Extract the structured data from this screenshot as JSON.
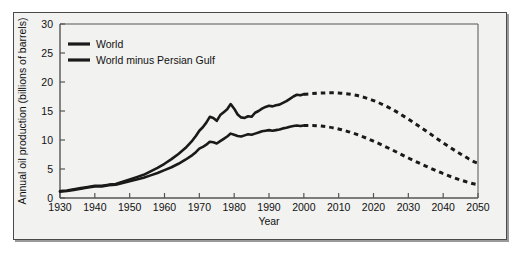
{
  "figure": {
    "background_color": "#f2f2f0",
    "frame_color": "#4a4a4a",
    "line_color": "#1a1a1a"
  },
  "chart_data": {
    "type": "line",
    "title": "",
    "xlabel": "Year",
    "ylabel": "Annual oil production (billions of barrels)",
    "xlim": [
      1930,
      2050
    ],
    "ylim": [
      0,
      30
    ],
    "xticks": [
      1930,
      1940,
      1950,
      1960,
      1970,
      1980,
      1990,
      2000,
      2010,
      2020,
      2030,
      2040,
      2050
    ],
    "yticks": [
      0,
      5,
      10,
      15,
      20,
      25,
      30
    ],
    "grid": false,
    "legend_position": "top-left",
    "legend": [
      "World",
      "World minus Persian Gulf"
    ],
    "annotations": [],
    "series": [
      {
        "name": "World",
        "style": "solid-then-dotted",
        "solid_x": [
          1930,
          1932,
          1934,
          1936,
          1938,
          1940,
          1942,
          1944,
          1946,
          1948,
          1950,
          1952,
          1954,
          1956,
          1958,
          1960,
          1962,
          1964,
          1966,
          1968,
          1969,
          1970,
          1971,
          1972,
          1973,
          1974,
          1975,
          1976,
          1977,
          1978,
          1979,
          1980,
          1981,
          1982,
          1983,
          1984,
          1985,
          1986,
          1987,
          1988,
          1989,
          1990,
          1991,
          1992,
          1993,
          1994,
          1995,
          1996,
          1997,
          1998,
          1999,
          2000
        ],
        "solid_y": [
          1.2,
          1.3,
          1.5,
          1.7,
          1.9,
          2.1,
          2.1,
          2.3,
          2.4,
          2.8,
          3.2,
          3.6,
          4.0,
          4.6,
          5.2,
          5.9,
          6.7,
          7.6,
          8.6,
          9.9,
          10.7,
          11.6,
          12.2,
          13.0,
          14.0,
          13.8,
          13.3,
          14.3,
          14.8,
          15.3,
          16.2,
          15.4,
          14.4,
          13.9,
          13.8,
          14.1,
          14.0,
          14.7,
          15.0,
          15.4,
          15.7,
          15.9,
          15.8,
          16.0,
          16.1,
          16.4,
          16.7,
          17.1,
          17.5,
          17.8,
          17.7,
          17.9
        ],
        "dotted_x": [
          2000,
          2005,
          2010,
          2015,
          2020,
          2025,
          2030,
          2035,
          2040,
          2045,
          2050
        ],
        "dotted_y": [
          17.9,
          18.1,
          18.1,
          17.7,
          16.8,
          15.4,
          13.6,
          11.6,
          9.5,
          7.6,
          6.0
        ],
        "note": "upper curve peaks near 2005 at about 18 and declines to about 5-6 by 2050"
      },
      {
        "name": "World minus Persian Gulf",
        "style": "solid-then-dotted",
        "solid_x": [
          1930,
          1932,
          1934,
          1936,
          1938,
          1940,
          1942,
          1944,
          1946,
          1948,
          1950,
          1952,
          1954,
          1956,
          1958,
          1960,
          1962,
          1964,
          1966,
          1968,
          1969,
          1970,
          1971,
          1972,
          1973,
          1974,
          1975,
          1976,
          1977,
          1978,
          1979,
          1980,
          1981,
          1982,
          1983,
          1984,
          1985,
          1986,
          1987,
          1988,
          1989,
          1990,
          1991,
          1992,
          1993,
          1994,
          1995,
          1996,
          1997,
          1998,
          1999,
          2000
        ],
        "solid_y": [
          1.1,
          1.2,
          1.4,
          1.6,
          1.8,
          2.0,
          2.0,
          2.2,
          2.3,
          2.6,
          2.9,
          3.2,
          3.5,
          3.9,
          4.3,
          4.8,
          5.3,
          5.9,
          6.6,
          7.4,
          7.9,
          8.5,
          8.8,
          9.2,
          9.7,
          9.6,
          9.4,
          9.8,
          10.2,
          10.6,
          11.1,
          10.9,
          10.7,
          10.6,
          10.8,
          11.0,
          10.9,
          11.1,
          11.3,
          11.5,
          11.6,
          11.7,
          11.6,
          11.7,
          11.8,
          12.0,
          12.1,
          12.3,
          12.4,
          12.5,
          12.4,
          12.5
        ],
        "dotted_x": [
          2000,
          2005,
          2010,
          2015,
          2020,
          2025,
          2030,
          2035,
          2040,
          2045,
          2050
        ],
        "dotted_y": [
          12.5,
          12.4,
          11.9,
          11.0,
          9.8,
          8.4,
          6.9,
          5.5,
          4.2,
          3.1,
          2.3
        ],
        "note": "lower curve peaks near 2000 at about 12.5 and declines to about 2 by 2050"
      }
    ]
  },
  "axes": {
    "x_axis_title": "Year",
    "y_axis_title": "Annual oil production (billions of barrels)",
    "x_tick_labels": [
      "1930",
      "1940",
      "1950",
      "1960",
      "1970",
      "1980",
      "1990",
      "2000",
      "2010",
      "2020",
      "2030",
      "2040",
      "2050"
    ],
    "y_tick_labels": [
      "0",
      "5",
      "10",
      "15",
      "20",
      "25",
      "30"
    ]
  },
  "legend": {
    "items": [
      {
        "label": "World",
        "swatch": "line-swatch-solid"
      },
      {
        "label": "World minus Persian Gulf",
        "swatch": "line-swatch-solid"
      }
    ]
  }
}
